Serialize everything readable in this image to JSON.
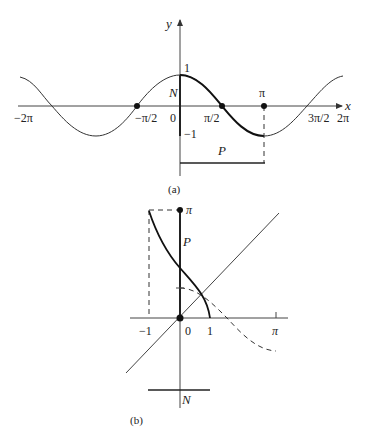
{
  "figure_a": {
    "caption": "(a)",
    "axis_labels": {
      "x": "x",
      "y": "y"
    },
    "y_ticks": {
      "one": "1",
      "neg_one": "−1"
    },
    "x_ticks": {
      "neg_two_pi": "−2π",
      "neg_half_pi": "−π/2",
      "zero": "0",
      "half_pi": "π/2",
      "pi": "π",
      "three_half_pi": "3π/2",
      "two_pi": "2π"
    },
    "region_labels": {
      "N": "N",
      "P": "P"
    },
    "curve": "y = cos x, bold on [0, π]"
  },
  "figure_b": {
    "caption": "(b)",
    "ticks": {
      "neg_one": "−1",
      "zero": "0",
      "one": "1",
      "pi_x": "π",
      "pi_y": "π"
    },
    "region_labels": {
      "N": "N",
      "P": "P"
    },
    "curves": "arccos x (solid bold), cos x (dashed), y = x (thin diagonal)"
  },
  "footer_text": ""
}
